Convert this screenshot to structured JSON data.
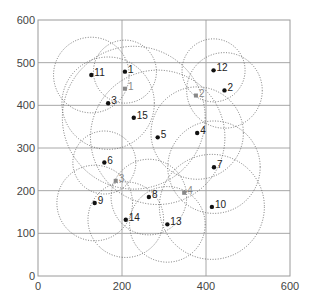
{
  "chart_data": {
    "type": "scatter",
    "title": "",
    "xlabel": "",
    "ylabel": "",
    "xlim": [
      0,
      600
    ],
    "ylim": [
      0,
      600
    ],
    "xticks": [
      0,
      200,
      400,
      600
    ],
    "yticks": [
      0,
      100,
      200,
      300,
      400,
      500,
      600
    ],
    "grid": true,
    "legend": null,
    "series": [
      {
        "name": "nodes",
        "marker": "circle",
        "color": "#111111",
        "points": [
          {
            "label": "1",
            "x": 207,
            "y": 479,
            "r": 75
          },
          {
            "label": "2",
            "x": 444,
            "y": 435,
            "r": 90
          },
          {
            "label": "3",
            "x": 167,
            "y": 405,
            "r": 110
          },
          {
            "label": "4",
            "x": 379,
            "y": 335,
            "r": 110
          },
          {
            "label": "5",
            "x": 285,
            "y": 325,
            "r": 160
          },
          {
            "label": "6",
            "x": 158,
            "y": 266,
            "r": 75
          },
          {
            "label": "7",
            "x": 419,
            "y": 255,
            "r": 110
          },
          {
            "label": "8",
            "x": 264,
            "y": 185,
            "r": 90
          },
          {
            "label": "9",
            "x": 135,
            "y": 171,
            "r": 90
          },
          {
            "label": "10",
            "x": 414,
            "y": 162,
            "r": 125
          },
          {
            "label": "11",
            "x": 127,
            "y": 471,
            "r": 90
          },
          {
            "label": "12",
            "x": 418,
            "y": 482,
            "r": 75
          },
          {
            "label": "13",
            "x": 308,
            "y": 121,
            "r": 90
          },
          {
            "label": "14",
            "x": 209,
            "y": 132,
            "r": 90
          },
          {
            "label": "15",
            "x": 228,
            "y": 371,
            "r": 170
          }
        ]
      },
      {
        "name": "anchors",
        "marker": "square",
        "color": "#888888",
        "points": [
          {
            "label": "1",
            "x": 207,
            "y": 439
          },
          {
            "label": "2",
            "x": 376,
            "y": 423
          },
          {
            "label": "3",
            "x": 185,
            "y": 223
          },
          {
            "label": "4",
            "x": 348,
            "y": 195
          }
        ]
      }
    ],
    "annotations": "Dotted circles show communication range around each node"
  }
}
